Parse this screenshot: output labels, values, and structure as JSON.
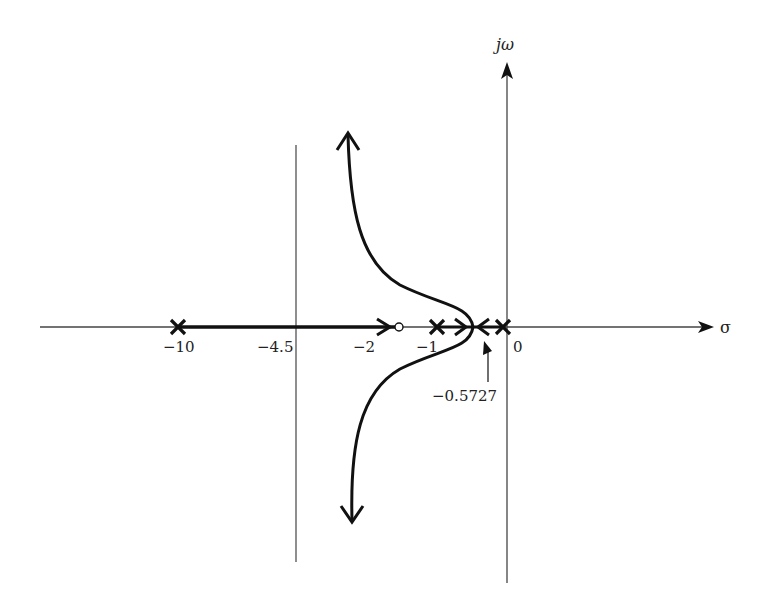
{
  "diagram": {
    "type": "root-locus",
    "axes": {
      "real_label": "σ",
      "imag_label": "jω"
    },
    "tick_labels": {
      "neg10": "−10",
      "neg4_5": "−4.5",
      "neg2": "−2",
      "neg1": "−1",
      "zero": "0"
    },
    "breakaway_label": "−0.5727",
    "poles": [
      -10,
      -1,
      -0.7,
      -0.4,
      0
    ],
    "zeros": [
      -2
    ],
    "asymptote_center": -4.5,
    "breakaway_point": -0.5727,
    "colors": {
      "locus": "#111111",
      "axes": "#444444",
      "text": "#222222"
    }
  }
}
